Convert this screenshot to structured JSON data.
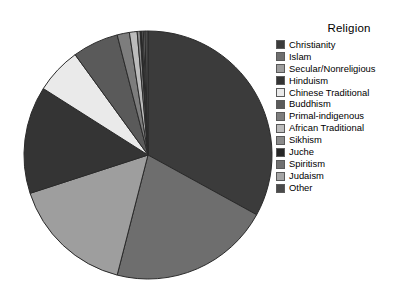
{
  "chart_data": {
    "type": "pie",
    "title": "",
    "legend_title": "Religion",
    "legend_position": "right",
    "categories": [
      "Christianity",
      "Islam",
      "Secular/Nonreligious",
      "Hinduism",
      "Chinese Traditional",
      "Buddhism",
      "Primal-indigenous",
      "African Traditional",
      "Sikhism",
      "Juche",
      "Spiritism",
      "Judaism",
      "Other"
    ],
    "values": [
      33.0,
      21.0,
      16.0,
      14.0,
      6.0,
      6.0,
      1.6,
      1.0,
      0.4,
      0.2,
      0.2,
      0.2,
      0.4
    ],
    "colors": [
      "#3b3b3b",
      "#6e6e6e",
      "#9e9e9e",
      "#343434",
      "#eaeaea",
      "#5a5a5a",
      "#7d7d7d",
      "#bcbcbc",
      "#8a8a8a",
      "#262626",
      "#707070",
      "#a5a5a5",
      "#4a4a4a"
    ],
    "start_angle": 0,
    "direction": "clockwise",
    "center": [
      148,
      155
    ],
    "radius": 124,
    "outline_color": "#2a2a2a",
    "background": "#ffffff"
  },
  "legend": {
    "title": "Religion",
    "items": [
      {
        "label": "Christianity"
      },
      {
        "label": "Islam"
      },
      {
        "label": "Secular/Nonreligious"
      },
      {
        "label": "Hinduism"
      },
      {
        "label": "Chinese Traditional"
      },
      {
        "label": "Buddhism"
      },
      {
        "label": "Primal-indigenous"
      },
      {
        "label": "African Traditional"
      },
      {
        "label": "Sikhism"
      },
      {
        "label": "Juche"
      },
      {
        "label": "Spiritism"
      },
      {
        "label": "Judaism"
      },
      {
        "label": "Other"
      }
    ]
  }
}
